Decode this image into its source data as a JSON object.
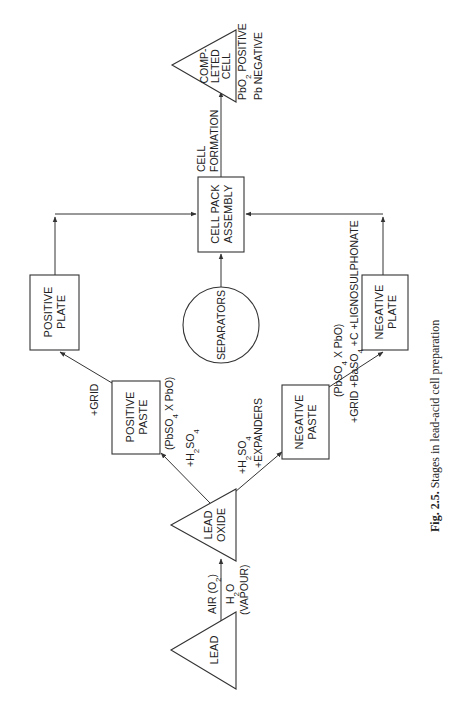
{
  "figure": {
    "caption_prefix": "Fig. 2.5.",
    "caption_text": " Stages in lead-acid cell preparation",
    "orientation": "rotated 90° counter-clockwise"
  },
  "nodes": {
    "lead": {
      "shape": "triangle",
      "lines": [
        "LEAD"
      ]
    },
    "lead_oxide": {
      "shape": "triangle",
      "lines": [
        "LEAD",
        "OXIDE"
      ]
    },
    "positive_paste": {
      "shape": "box",
      "lines": [
        "POSITIVE",
        "PASTE"
      ]
    },
    "negative_paste": {
      "shape": "box",
      "lines": [
        "NEGATIVE",
        "PASTE"
      ]
    },
    "positive_plate": {
      "shape": "box",
      "lines": [
        "POSITIVE",
        "PLATE"
      ]
    },
    "negative_plate": {
      "shape": "box",
      "lines": [
        "NEGATIVE",
        "PLATE"
      ]
    },
    "separators": {
      "shape": "circle",
      "lines": [
        "SEPARATORS"
      ]
    },
    "cell_pack_assembly": {
      "shape": "box",
      "lines": [
        "CELL PACK",
        "ASSEMBLY"
      ]
    },
    "completed_cell": {
      "shape": "triangle",
      "lines": [
        "COMP-",
        "LETED",
        "CELL"
      ]
    }
  },
  "edge_labels": {
    "lead_to_oxide": {
      "air": "AIR (O",
      "air_sub": "2",
      "air_close": ")",
      "h2o_h": "H",
      "h2o_sub": "2",
      "h2o_o": "O",
      "vapour": "(VAPOUR)"
    },
    "oxide_to_pos_paste": {
      "plus_h": "+H",
      "sub2": "2",
      "so": "SO",
      "sub4": "4"
    },
    "oxide_to_neg_paste": {
      "plus_h": "+H",
      "sub2": "2",
      "so": "SO",
      "sub4": "4",
      "expanders": "+EXPANDERS"
    },
    "pos_paste_formula": {
      "open": "(PbSO",
      "sub4": "4",
      "rest": " X PbO)"
    },
    "pos_paste_to_plate": {
      "grid": "+GRID"
    },
    "neg_paste_formula": {
      "open": "(PbSO",
      "sub4": "4",
      "rest": " X PbO)"
    },
    "neg_paste_to_plate": {
      "grid": "+GRID ",
      "baso": "+BaSO",
      "sub4": "4",
      "rest": " +C +LIGNOSULPHONATE"
    },
    "cell_formation": {
      "line1": "CELL",
      "line2": "FORMATION"
    },
    "completed_cell_notes": {
      "pbo": "PbO",
      "sub2": "2",
      "positive": " POSITIVE",
      "negative": "Pb NEGATIVE"
    }
  },
  "colors": {
    "line": "#333333",
    "text": "#222222",
    "background": "#ffffff"
  }
}
